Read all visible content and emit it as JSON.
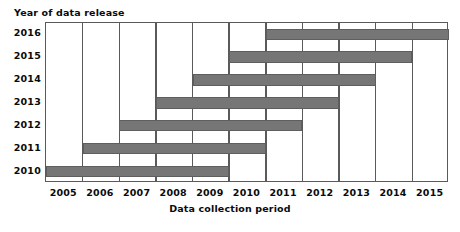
{
  "chart_data": {
    "type": "bar",
    "orientation": "horizontal",
    "subtype": "gantt",
    "title": "",
    "ylabel": "Year of data release",
    "xlabel": "Data collection period",
    "categories": [
      "2016",
      "2015",
      "2014",
      "2013",
      "2012",
      "2011",
      "2010"
    ],
    "xticklabels": [
      "2005",
      "2006",
      "2007",
      "2008",
      "2009",
      "2010",
      "2011",
      "2012",
      "2013",
      "2014",
      "2015"
    ],
    "xlim": [
      2005,
      2016
    ],
    "grid": true,
    "legend": null,
    "bar_color": "#767676",
    "axis_color": "#5a5a5a",
    "bars": [
      {
        "category": "2016",
        "start": 2011,
        "end": 2016,
        "span_label": "2011-2016"
      },
      {
        "category": "2015",
        "start": 2010,
        "end": 2015,
        "span_label": "2010-2015"
      },
      {
        "category": "2014",
        "start": 2009,
        "end": 2014,
        "span_label": "2009-2014"
      },
      {
        "category": "2013",
        "start": 2008,
        "end": 2013,
        "span_label": "2008-2013"
      },
      {
        "category": "2012",
        "start": 2007,
        "end": 2012,
        "span_label": "2007-2012"
      },
      {
        "category": "2011",
        "start": 2006,
        "end": 2011,
        "span_label": "2006-2011"
      },
      {
        "category": "2010",
        "start": 2005,
        "end": 2010,
        "span_label": "2005-2010"
      }
    ]
  }
}
